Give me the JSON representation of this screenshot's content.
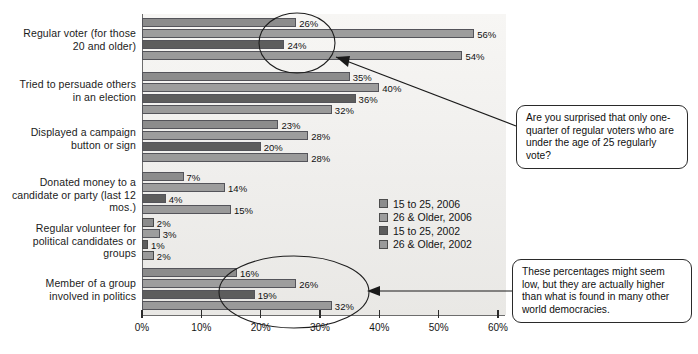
{
  "chart_data": {
    "type": "bar",
    "orientation": "horizontal",
    "title": "",
    "subtitle": "",
    "xlabel": "",
    "ylabel": "",
    "xlim": [
      0,
      60
    ],
    "grid": false,
    "legend_position": "center-right",
    "tick_labels": [
      "0%",
      "10%",
      "20%",
      "30%",
      "40%",
      "50%",
      "60%"
    ],
    "tick_values": [
      0,
      10,
      20,
      30,
      40,
      50,
      60
    ],
    "categories": [
      "Regular voter (for those 20 and older)",
      "Tried to persuade others in an election",
      "Displayed a campaign button or sign",
      "Donated money to a candidate or party (last 12 mos.)",
      "Regular volunteer for political candidates or groups",
      "Member of a group involved in politics"
    ],
    "series": [
      {
        "name": "15 to 25, 2006",
        "color": "#8c8c8c",
        "values": [
          26,
          35,
          23,
          7,
          2,
          16
        ]
      },
      {
        "name": "26 & Older, 2006",
        "color": "#9d9d9d",
        "values": [
          56,
          40,
          28,
          14,
          3,
          26
        ]
      },
      {
        "name": "15 to 25, 2002",
        "color": "#5d5d5d",
        "values": [
          24,
          36,
          20,
          4,
          1,
          19
        ]
      },
      {
        "name": "26 & Older, 2002",
        "color": "#9a9a9a",
        "values": [
          54,
          32,
          28,
          15,
          2,
          32
        ]
      }
    ],
    "value_labels": [
      [
        "26%",
        "56%",
        "24%",
        "54%"
      ],
      [
        "35%",
        "40%",
        "36%",
        "32%"
      ],
      [
        "23%",
        "28%",
        "20%",
        "28%"
      ],
      [
        "7%",
        "14%",
        "4%",
        "15%"
      ],
      [
        "2%",
        "3%",
        "1%",
        "2%"
      ],
      [
        "16%",
        "26%",
        "19%",
        "32%"
      ]
    ],
    "annotations": [
      {
        "name": "callout-voters",
        "text": "Are you surprised that only one-quarter of regular voters who are under the age of 25 regularly vote?",
        "target": "Regular voter 24% / 26% bars"
      },
      {
        "name": "callout-democracies",
        "text": "These percentages might seem low, but they are actually higher than what is found in many other world democracies.",
        "target": "Member of a group involved in politics bars"
      }
    ],
    "highlight_ellipses": [
      {
        "name": "ellipse-regular-voter",
        "about": "circles the 26% and 24% labels for regular voters"
      },
      {
        "name": "ellipse-group-member",
        "about": "circles the 16%/19%/26%/32% member-of-group bars and 20-30% ticks"
      }
    ]
  },
  "legend": {
    "items": [
      {
        "label": "15 to 25, 2006",
        "swatch": "s0"
      },
      {
        "label": "26 & Older, 2006",
        "swatch": "s1"
      },
      {
        "label": "15 to 25, 2002",
        "swatch": "s2"
      },
      {
        "label": "26 & Older, 2002",
        "swatch": "s3"
      }
    ]
  },
  "callouts": {
    "voters": "Are you surprised that only one-quarter of regular voters who are under the age of 25 regularly vote?",
    "democracies": "These percentages might seem low, but they are actually higher than what is found in many other world democracies."
  },
  "colors": {
    "series_0": "#8c8c8c",
    "series_1": "#9d9d9d",
    "series_2": "#5d5d5d",
    "series_3": "#9a9a9a",
    "panel": "#f2f1ef",
    "axis": "#6d6d6d",
    "text": "#141414"
  }
}
